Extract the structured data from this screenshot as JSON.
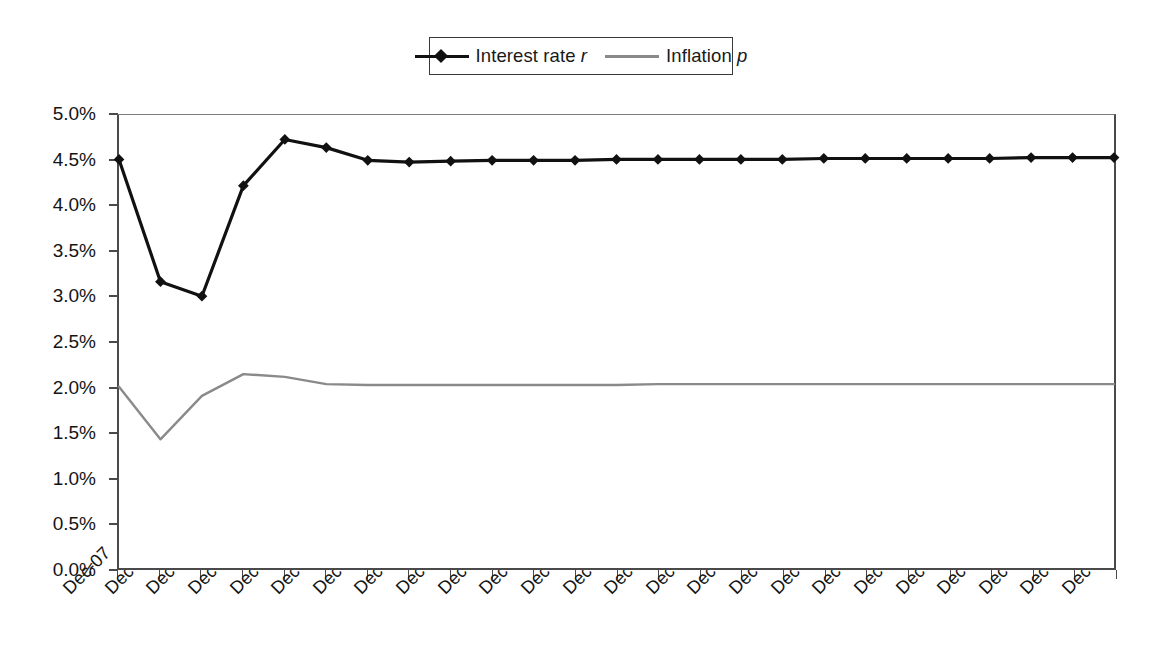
{
  "chart_data": {
    "type": "line",
    "title": "",
    "subtitle": "",
    "xlabel": "",
    "ylabel": "",
    "categories": [
      "Dec-07",
      "Dec-08",
      "Dec-09",
      "Dec-10",
      "Dec-11",
      "Dec-12",
      "Dec-13",
      "Dec-14",
      "Dec-15",
      "Dec-16",
      "Dec-17",
      "Dec-18",
      "Dec-19",
      "Dec-20",
      "Dec-21",
      "Dec-22",
      "Dec-23",
      "Dec-24",
      "Dec-25",
      "Dec-26",
      "Dec-27",
      "Dec-28",
      "Dec-29",
      "Dec-30",
      "Dec-31"
    ],
    "series": [
      {
        "name": "Interest rate r",
        "name_plain": "Interest rate",
        "name_symbol": "r",
        "color": "#111111",
        "marker": "diamond",
        "values": [
          4.51,
          3.16,
          3.0,
          4.22,
          4.73,
          4.64,
          4.5,
          4.48,
          4.49,
          4.5,
          4.5,
          4.5,
          4.51,
          4.51,
          4.51,
          4.51,
          4.51,
          4.52,
          4.52,
          4.52,
          4.52,
          4.52,
          4.53,
          4.53,
          4.53
        ]
      },
      {
        "name": "Inflation p",
        "name_plain": "Inflation",
        "name_symbol": "p",
        "color": "#8a8a8a",
        "marker": "none",
        "values": [
          2.0,
          1.42,
          1.9,
          2.14,
          2.11,
          2.03,
          2.02,
          2.02,
          2.02,
          2.02,
          2.02,
          2.02,
          2.02,
          2.03,
          2.03,
          2.03,
          2.03,
          2.03,
          2.03,
          2.03,
          2.03,
          2.03,
          2.03,
          2.03,
          2.03
        ]
      }
    ],
    "ylim": [
      0.0,
      5.0
    ],
    "ytick_values": [
      5.0,
      4.5,
      4.0,
      3.5,
      3.0,
      2.5,
      2.0,
      1.5,
      1.0,
      0.5,
      0.0
    ],
    "ytick_labels": [
      "5.0%",
      "4.5%",
      "4.0%",
      "3.5%",
      "3.0%",
      "2.5%",
      "2.0%",
      "1.5%",
      "1.0%",
      "0.5%",
      "0.0%"
    ],
    "grid": false,
    "legend_position": "top-center",
    "xtick_rotation": -45
  }
}
